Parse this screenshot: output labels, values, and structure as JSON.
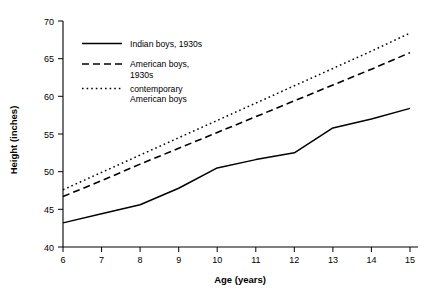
{
  "chart_data": {
    "type": "line",
    "title": "",
    "xlabel": "Age (years)",
    "ylabel": "Height (inches)",
    "xlim": [
      6,
      15
    ],
    "ylim": [
      40,
      70
    ],
    "xticks": [
      "6",
      "7",
      "8",
      "9",
      "10",
      "11",
      "12",
      "13",
      "14",
      "15"
    ],
    "yticks": [
      "40",
      "45",
      "50",
      "55",
      "60",
      "65",
      "70"
    ],
    "grid": false,
    "legend_position": "upper-left-inside",
    "x": [
      6,
      7,
      8,
      9,
      10,
      11,
      12,
      13,
      14,
      15
    ],
    "series": [
      {
        "name": "Indian boys, 1930s",
        "style": "solid",
        "color": "#000000",
        "values": [
          43.2,
          44.4,
          45.6,
          47.8,
          50.5,
          51.6,
          52.5,
          55.8,
          57.0,
          58.4
        ]
      },
      {
        "name": "American boys, 1930s",
        "style": "dashed",
        "color": "#000000",
        "values": [
          46.7,
          48.8,
          51.0,
          53.1,
          55.2,
          57.3,
          59.4,
          61.5,
          63.6,
          65.8
        ]
      },
      {
        "name": "contemporary American boys",
        "style": "dotted",
        "color": "#000000",
        "values": [
          47.6,
          49.9,
          52.2,
          54.5,
          56.8,
          59.1,
          61.4,
          63.7,
          66.0,
          68.4
        ]
      }
    ]
  },
  "legend": {
    "items": [
      {
        "label_line1": "Indian boys, 1930s",
        "label_line2": ""
      },
      {
        "label_line1": "American boys,",
        "label_line2": "1930s"
      },
      {
        "label_line1": "contemporary",
        "label_line2": "American boys"
      }
    ]
  },
  "axis": {
    "x_title": "Age (years)",
    "y_title": "Height (inches)"
  }
}
